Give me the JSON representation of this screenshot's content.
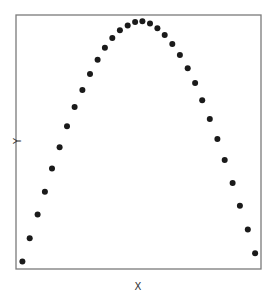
{
  "chart_data": {
    "type": "scatter",
    "title": "",
    "xlabel": "X",
    "ylabel": "Y",
    "grid": false,
    "legend": null,
    "ticks": "none",
    "xlim": [
      0,
      1
    ],
    "ylim": [
      0,
      1
    ],
    "marker_color": "#1a1a1a",
    "frame_color": "#7a7a7a",
    "note": "No tick labels shown; values are normalized to plot frame (0 = left/bottom, 1 = right/top)",
    "x": [
      0.026,
      0.056,
      0.088,
      0.118,
      0.147,
      0.178,
      0.208,
      0.239,
      0.271,
      0.302,
      0.333,
      0.363,
      0.393,
      0.424,
      0.456,
      0.486,
      0.516,
      0.547,
      0.577,
      0.607,
      0.638,
      0.669,
      0.701,
      0.731,
      0.76,
      0.791,
      0.822,
      0.852,
      0.884,
      0.914,
      0.946,
      0.976
    ],
    "y": [
      0.029,
      0.121,
      0.214,
      0.304,
      0.396,
      0.479,
      0.562,
      0.638,
      0.705,
      0.768,
      0.824,
      0.871,
      0.909,
      0.94,
      0.959,
      0.972,
      0.975,
      0.967,
      0.948,
      0.921,
      0.886,
      0.843,
      0.79,
      0.732,
      0.664,
      0.591,
      0.512,
      0.429,
      0.339,
      0.249,
      0.156,
      0.062
    ]
  },
  "layout": {
    "frame": {
      "left": 16,
      "top": 15,
      "width": 245,
      "height": 254
    },
    "xlabel_pos": {
      "x": 138,
      "y": 290
    },
    "ylabel_pos": {
      "x": 21,
      "y": 141
    },
    "marker_radius": 3
  }
}
